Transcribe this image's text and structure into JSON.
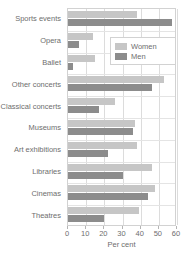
{
  "chart_data": {
    "type": "bar",
    "orientation": "horizontal",
    "title": "",
    "xlabel": "Per cent",
    "ylabel": "",
    "xlim": [
      0,
      60
    ],
    "xticks": [
      0,
      10,
      20,
      30,
      40,
      50,
      60
    ],
    "grid": true,
    "legend_position": "upper-right",
    "categories": [
      "Sports events",
      "Opera",
      "Ballet",
      "Other concerts",
      "Classical concerts",
      "Museums",
      "Art exhibitions",
      "Libraries",
      "Cinemas",
      "Theatres"
    ],
    "series": [
      {
        "name": "Women",
        "color": "#c6c6c6",
        "values": [
          38,
          14,
          15,
          53,
          26,
          37,
          38,
          46,
          48,
          39
        ]
      },
      {
        "name": "Men",
        "color": "#8c8c8c",
        "values": [
          57,
          6,
          3,
          46,
          17,
          36,
          22,
          30,
          44,
          20
        ]
      }
    ]
  },
  "legend": {
    "items": [
      {
        "label": "Women",
        "swatch": "women-swatch"
      },
      {
        "label": "Men",
        "swatch": "men-swatch"
      }
    ]
  },
  "axis": {
    "x_title": "Per cent",
    "tick_labels": [
      "0",
      "10",
      "20",
      "30",
      "40",
      "50",
      "60"
    ]
  },
  "colors": {
    "women": "#c6c6c6",
    "men": "#8c8c8c",
    "grid": "#dcdcdc",
    "text": "#6e6e6e"
  }
}
